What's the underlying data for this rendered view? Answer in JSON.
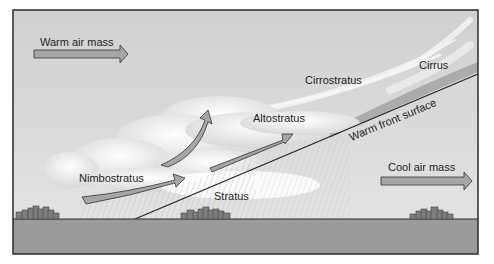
{
  "diagram": {
    "labels": {
      "warm_air_mass": "Warm air mass",
      "cool_air_mass": "Cool air mass",
      "cirrus": "Cirrus",
      "cirrostratus": "Cirrostratus",
      "altostratus": "Altostratus",
      "nimbostratus": "Nimbostratus",
      "stratus": "Stratus",
      "warm_front_surface": "Warm front surface"
    },
    "colors": {
      "sky_top": "#d2d2d2",
      "sky_bottom": "#e4e4e4",
      "ground": "#9a9a9a",
      "arrow_fill": "#a6a6a6",
      "outline": "#2a2a2a",
      "cloud": "#f4f4f4",
      "buildings": "#7a7a7a"
    },
    "elements": [
      "warm air mass arrow pointing right",
      "cool air mass arrow pointing right",
      "four curved rising air arrows",
      "sloped warm front surface line",
      "cloud band sequence: cirrus, cirrostratus, altostratus, nimbostratus, stratus",
      "precipitation streaks beneath nimbostratus",
      "three town silhouettes on ground"
    ]
  }
}
